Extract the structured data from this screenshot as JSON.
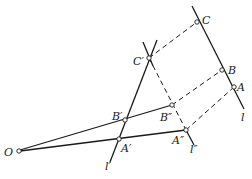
{
  "diagram": {
    "labels": {
      "O": "O",
      "A": "A",
      "B": "B",
      "C": "C",
      "A_prime": "A′",
      "B_prime": "B′",
      "C_prime": "C′",
      "A_dprime": "A″",
      "B_dprime": "B″",
      "l": "l",
      "l_prime": "l′",
      "l_dprime": "l″"
    },
    "points": {
      "O": [
        18,
        151
      ],
      "A": [
        234,
        87
      ],
      "B": [
        222,
        70
      ],
      "C": [
        197,
        22
      ],
      "A_prime": [
        119,
        139
      ],
      "B_prime": [
        125,
        120
      ],
      "C_prime": [
        149,
        58
      ],
      "A_dprime": [
        186,
        130
      ],
      "B_dprime": [
        172,
        105
      ]
    },
    "colors": {
      "ink": "#1a1a1a",
      "background": "#ffffff"
    }
  }
}
